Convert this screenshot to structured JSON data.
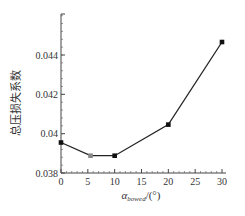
{
  "chart_data": {
    "type": "line",
    "title": "",
    "xlabel": "α_bowed/(°)",
    "xlabel_main": "α",
    "xlabel_sub": "bowed",
    "xlabel_unit": "/(°)",
    "ylabel": "总压损失系数",
    "xlim": [
      0,
      30
    ],
    "ylim": [
      0.038,
      0.0461
    ],
    "x_ticks": [
      0,
      5,
      10,
      15,
      20,
      25,
      30
    ],
    "y_ticks": [
      0.038,
      0.04,
      0.042,
      0.044
    ],
    "x_tick_labels": [
      "0",
      "5",
      "10",
      "15",
      "20",
      "25",
      "30"
    ],
    "y_tick_labels": [
      "0.038",
      "0.04",
      "0.042",
      "0.044"
    ],
    "grid": false,
    "legend": null,
    "series": [
      {
        "name": "总压损失系数",
        "x": [
          0,
          5.5,
          10,
          20,
          30
        ],
        "y": [
          0.03955,
          0.03888,
          0.03888,
          0.04046,
          0.04466
        ],
        "marker": "square",
        "highlight_index": 1,
        "line_color": "#222222",
        "marker_color": "#111111",
        "highlight_color": "#888888"
      }
    ]
  }
}
